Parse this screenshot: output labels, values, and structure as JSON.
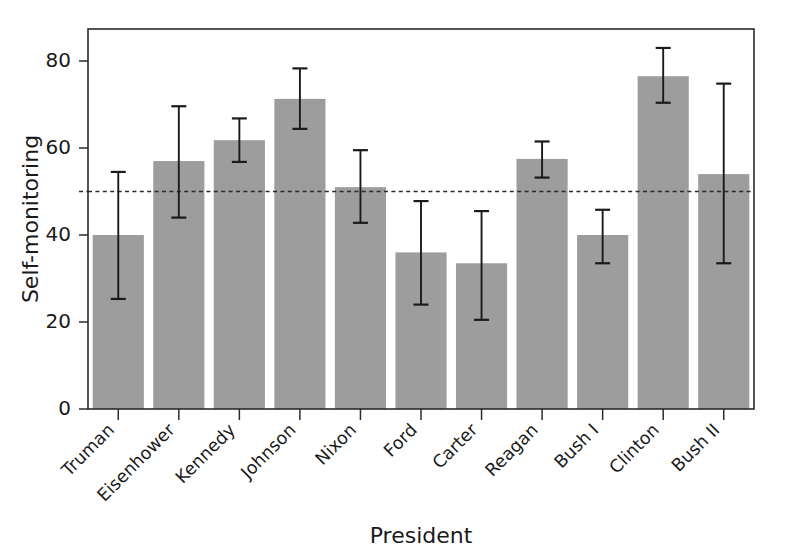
{
  "chart_data": {
    "type": "bar",
    "title": "",
    "xlabel": "President",
    "ylabel": "Self-monitoring",
    "categories": [
      "Truman",
      "Eisenhower",
      "Kennedy",
      "Johnson",
      "Nixon",
      "Ford",
      "Carter",
      "Reagan",
      "Bush I",
      "Clinton",
      "Bush II"
    ],
    "values": [
      40.0,
      57.0,
      61.8,
      71.3,
      51.0,
      36.0,
      33.5,
      57.5,
      40.0,
      76.5,
      54.0
    ],
    "error_low": [
      25.3,
      44.0,
      56.8,
      64.4,
      42.8,
      24.0,
      20.5,
      53.2,
      33.5,
      70.4,
      33.5
    ],
    "error_high": [
      54.5,
      69.6,
      66.8,
      78.3,
      59.5,
      47.8,
      45.5,
      61.5,
      45.8,
      83.0,
      74.8
    ],
    "yticks": [
      0,
      20,
      40,
      60,
      80
    ],
    "ytick_labels": [
      "0",
      "20",
      "40",
      "60",
      "80"
    ],
    "ylim": [
      0,
      84.5
    ],
    "xtick_label_rotation": -45,
    "reference_line": {
      "value": 50,
      "style": "dashed"
    },
    "grid": false,
    "legend": null,
    "bar_color": "#9d9d9d",
    "line_color": "#1a1a1a",
    "frame_color": "#2b2b2b",
    "background": "#ffffff"
  }
}
